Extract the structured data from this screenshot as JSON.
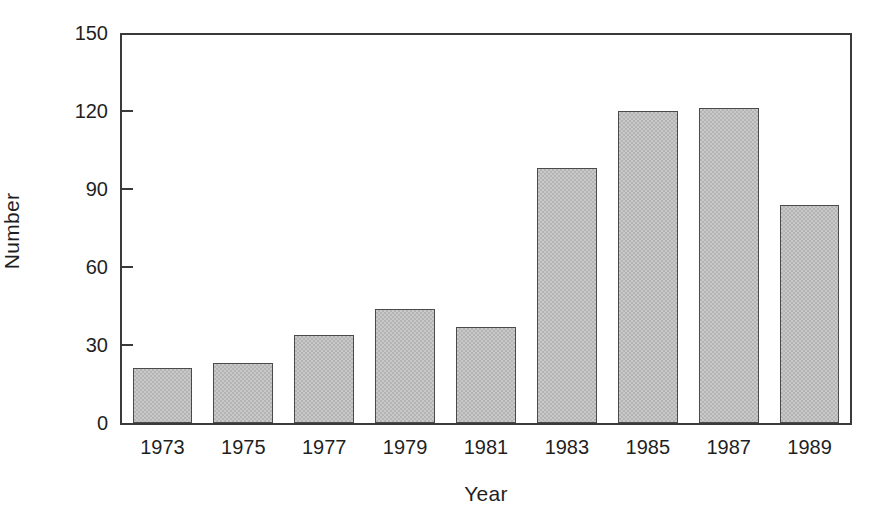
{
  "chart_data": {
    "type": "bar",
    "title": "",
    "xlabel": "Year",
    "ylabel": "Number",
    "categories": [
      "1973",
      "1975",
      "1977",
      "1979",
      "1981",
      "1983",
      "1985",
      "1987",
      "1989"
    ],
    "values": [
      21,
      23,
      34,
      44,
      37,
      98,
      120,
      121,
      84
    ],
    "ylim": [
      0,
      150
    ],
    "yticks": [
      0,
      30,
      60,
      90,
      120,
      150
    ],
    "ytick_labels": [
      "0",
      "30",
      "60",
      "90",
      "120",
      "150"
    ],
    "grid": false,
    "legend": null,
    "bar_fill_color": "#c9c9c9",
    "bar_edge_color": "#4a4a4a",
    "axis_color": "#3a3a3a",
    "background_color": "#ffffff"
  }
}
